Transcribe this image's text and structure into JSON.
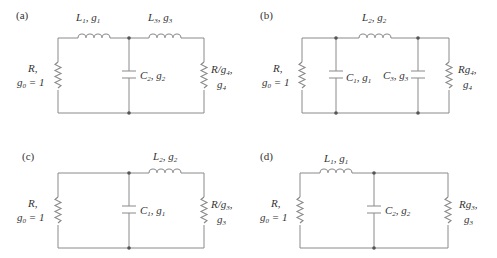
{
  "figure": {
    "panels": [
      {
        "tag": "(a)",
        "source": {
          "line1": "R,",
          "line2": "g",
          "line2_sub": "0",
          "line2_rest": " = 1"
        },
        "series": [
          {
            "sym": "L",
            "sub": "1",
            "g": "g",
            "gsub": "1"
          },
          {
            "sym": "L",
            "sub": "3",
            "g": "g",
            "gsub": "3"
          }
        ],
        "shunt": [
          {
            "sym": "C",
            "sub": "2",
            "g": "g",
            "gsub": "2"
          }
        ],
        "load": {
          "line1": "R/g",
          "line1_sub": "4",
          "line1_rest": ",",
          "line2": "g",
          "line2_sub": "4"
        }
      },
      {
        "tag": "(b)",
        "source": {
          "line1": "R,",
          "line2": "g",
          "line2_sub": "0",
          "line2_rest": " = 1"
        },
        "series": [
          {
            "sym": "L",
            "sub": "2",
            "g": "g",
            "gsub": "2"
          }
        ],
        "shunt": [
          {
            "sym": "C",
            "sub": "1",
            "g": "g",
            "gsub": "1"
          },
          {
            "sym": "C",
            "sub": "3",
            "g": "g",
            "gsub": "3"
          }
        ],
        "load": {
          "line1": "Rg",
          "line1_sub": "4",
          "line1_rest": ",",
          "line2": "g",
          "line2_sub": "4"
        }
      },
      {
        "tag": "(c)",
        "source": {
          "line1": "R,",
          "line2": "g",
          "line2_sub": "0",
          "line2_rest": " = 1"
        },
        "series": [
          {
            "sym": "L",
            "sub": "2",
            "g": "g",
            "gsub": "2"
          }
        ],
        "shunt": [
          {
            "sym": "C",
            "sub": "1",
            "g": "g",
            "gsub": "1"
          }
        ],
        "load": {
          "line1": "R/g",
          "line1_sub": "3",
          "line1_rest": ",",
          "line2": "g",
          "line2_sub": "3"
        }
      },
      {
        "tag": "(d)",
        "source": {
          "line1": "R,",
          "line2": "g",
          "line2_sub": "0",
          "line2_rest": " = 1"
        },
        "series": [
          {
            "sym": "L",
            "sub": "1",
            "g": "g",
            "gsub": "1"
          }
        ],
        "shunt": [
          {
            "sym": "C",
            "sub": "2",
            "g": "g",
            "gsub": "2"
          }
        ],
        "load": {
          "line1": "Rg",
          "line1_sub": "3",
          "line1_rest": ",",
          "line2": "g",
          "line2_sub": "3"
        }
      }
    ]
  }
}
